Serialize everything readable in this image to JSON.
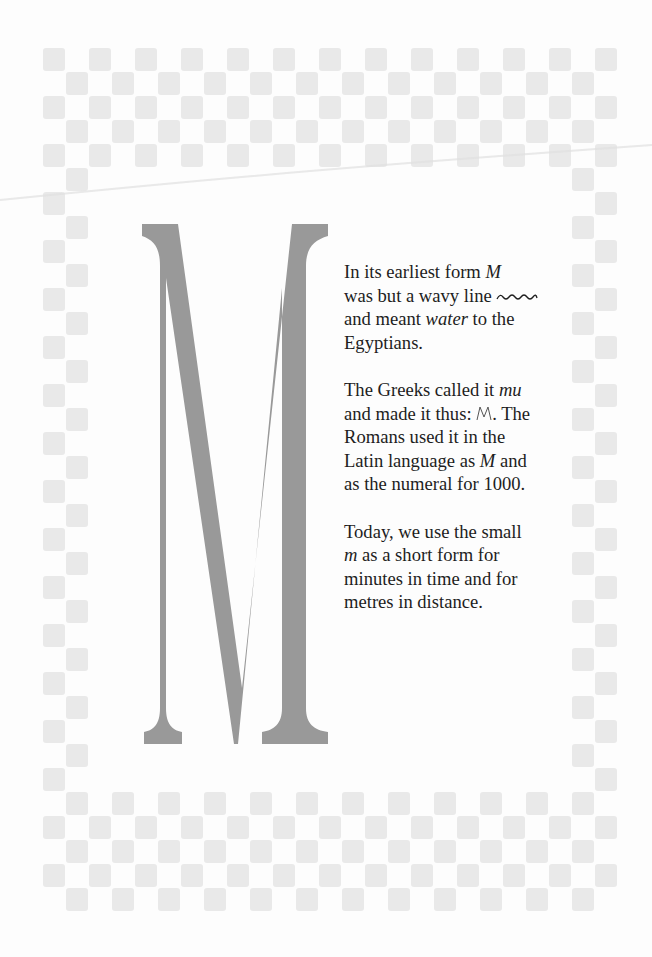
{
  "page": {
    "background": "#fdfdfd",
    "square_color": "#e9e9e9",
    "letter_color": "#999999"
  },
  "decoration": {
    "big_letter": "M",
    "border": {
      "origin_x": 43,
      "origin_y": 48,
      "cell_w": 23,
      "cell_h": 24,
      "cols": 25,
      "rows": 36,
      "top_rows": 5,
      "bottom_rows": 5,
      "side_cols": 2
    }
  },
  "text": {
    "p1": {
      "line1": "In its earliest form ",
      "m1": "M",
      "line2": "was but a wavy line",
      "line3a": "and meant ",
      "water": "water",
      "line3b": " to the",
      "line4": "Egyptians."
    },
    "p2": {
      "a": "The Greeks called it ",
      "mu": "mu",
      "b": "and made it thus:",
      "c": ". The",
      "d": "Romans used it in the",
      "e": "Latin language as ",
      "m2": "M",
      "f": " and",
      "g": "as the numeral for 1000."
    },
    "p3": {
      "a": "Today, we use the small",
      "m3": "m",
      "b": " as a short form for",
      "c": "minutes in time and for",
      "d": "metres in distance."
    }
  }
}
